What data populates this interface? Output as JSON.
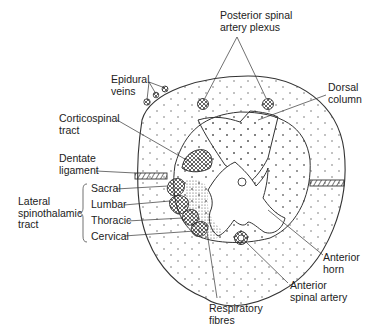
{
  "diagram": {
    "labels": {
      "posterior_spinal_artery_plexus": [
        "Posterior spinal",
        "artery plexus"
      ],
      "epidural_veins": [
        "Epidural",
        "veins"
      ],
      "dorsal_column": [
        "Dorsal",
        "column"
      ],
      "corticospinal_tract": [
        "Corticospinal",
        "tract"
      ],
      "dentate_ligament": [
        "Dentate",
        "ligament"
      ],
      "lateral_spinothalamic_tract": [
        "Lateral",
        "spinothalamic",
        "tract"
      ],
      "sacral": "Sacral",
      "lumbar": "Lumbar",
      "thoracic": "Thoracic",
      "cervical": "Cervical",
      "anterior_horn": [
        "Anterior",
        "horn"
      ],
      "anterior_spinal_artery": [
        "Anterior",
        "spinal artery"
      ],
      "respiratory_fibres": [
        "Respiratory",
        "fibres"
      ]
    },
    "colors": {
      "line": "#333333",
      "background": "#ffffff"
    }
  }
}
